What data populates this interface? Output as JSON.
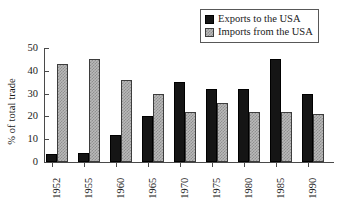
{
  "chart_data": {
    "type": "bar",
    "title": "",
    "subtitle": "",
    "xlabel": "",
    "ylabel": "% of total trade",
    "categories": [
      "1952",
      "1955",
      "1960",
      "1965",
      "1970",
      "1975",
      "1980",
      "1985",
      "1990"
    ],
    "series": [
      {
        "name": "Exports to the USA",
        "color": "#151515",
        "values": [
          3.5,
          4,
          12,
          20,
          35,
          32,
          32,
          45,
          30
        ]
      },
      {
        "name": "Imports from the USA",
        "color": "#b9b9b9",
        "values": [
          43,
          45,
          36,
          30,
          22,
          26,
          22,
          22,
          21
        ]
      }
    ],
    "ylim": [
      0,
      50
    ],
    "yticks": [
      0,
      10,
      20,
      30,
      40,
      50
    ],
    "ytick_labels": [
      "0",
      "10",
      "20",
      "30",
      "40",
      "50"
    ],
    "grid": false,
    "legend_position": "top-right",
    "xtick_rotation": 90
  },
  "legend": {
    "items": [
      {
        "label": "Exports to the USA",
        "swatch": "black-square-swatch"
      },
      {
        "label": "Imports from the USA",
        "swatch": "gray-checkered-square-swatch"
      }
    ]
  },
  "axes": {
    "y_title": "% of total trade"
  }
}
